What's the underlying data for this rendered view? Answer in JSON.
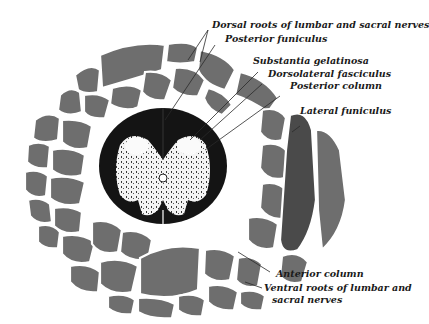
{
  "figure": {
    "labels": [
      {
        "id": "dorsal_roots",
        "text": "Dorsal roots of lumbar and sacral nerves"
      },
      {
        "id": "posterior_funiculus",
        "text": "Posterior funiculus"
      },
      {
        "id": "substantia_gelatinosa",
        "text": "Substantia gelatinosa"
      },
      {
        "id": "dorsolateral_fasciculus",
        "text": "Dorsolateral fasciculus"
      },
      {
        "id": "posterior_column",
        "text": "Posterior column"
      },
      {
        "id": "lateral_funiculus",
        "text": "Lateral funiculus"
      },
      {
        "id": "anterior_column",
        "text": "Anterior column"
      },
      {
        "id": "ventral_roots_line1",
        "text": "Ventral roots of lumbar and"
      },
      {
        "id": "ventral_roots_line2",
        "text": "sacral nerves"
      }
    ],
    "colors": {
      "background": "#ffffff",
      "white_matter": "#141414",
      "gray_matter": "#f2f2f2",
      "nerve_bundle": "#6e6e6e",
      "label_text": "#1a1a1a"
    }
  }
}
